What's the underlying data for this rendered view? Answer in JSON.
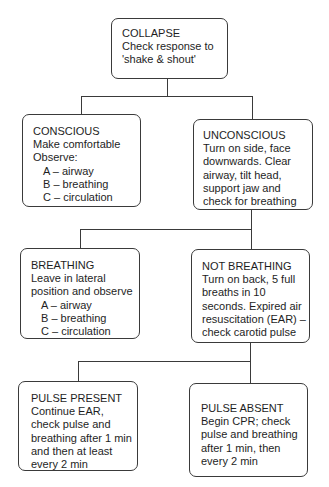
{
  "nodes": {
    "collapse": {
      "title": "COLLAPSE",
      "lines": [
        "Check response to",
        "'shake & shout'"
      ]
    },
    "conscious": {
      "title": "CONSCIOUS",
      "lines": [
        "Make comfortable",
        "Observe:"
      ],
      "list": [
        "A – airway",
        "B – breathing",
        "C – circulation"
      ]
    },
    "unconscious": {
      "title": "UNCONSCIOUS",
      "lines": [
        "Turn on side, face",
        "downwards. Clear",
        "airway, tilt head,",
        "support jaw and",
        "check for breathing"
      ]
    },
    "breathing": {
      "title": "BREATHING",
      "lines": [
        "Leave in lateral",
        "position and observe"
      ],
      "list": [
        "A – airway",
        "B – breathing",
        "C – circulation"
      ]
    },
    "not_breathing": {
      "title": "NOT BREATHING",
      "lines": [
        "Turn on back, 5 full",
        "breaths in 10",
        "seconds. Expired air",
        "resuscitation (EAR) –",
        "check carotid pulse"
      ]
    },
    "pulse_present": {
      "title": "PULSE PRESENT",
      "lines": [
        "Continue EAR,",
        "check pulse and",
        "breathing after 1 min",
        "and then at least",
        "every 2 min"
      ]
    },
    "pulse_absent": {
      "title": "PULSE ABSENT",
      "lines": [
        "Begin CPR; check",
        "pulse and breathing",
        "after 1 min, then",
        "every 2 min"
      ]
    }
  },
  "edges": [
    {
      "from": "collapse",
      "to": "conscious"
    },
    {
      "from": "collapse",
      "to": "unconscious"
    },
    {
      "from": "unconscious",
      "to": "breathing"
    },
    {
      "from": "unconscious",
      "to": "not_breathing"
    },
    {
      "from": "not_breathing",
      "to": "pulse_present"
    },
    {
      "from": "not_breathing",
      "to": "pulse_absent"
    }
  ]
}
